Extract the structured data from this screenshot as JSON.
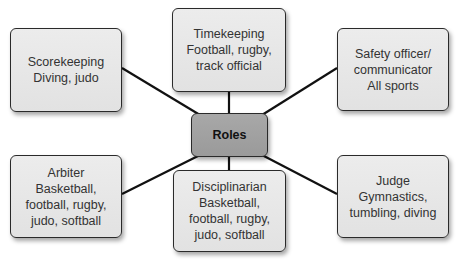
{
  "diagram": {
    "type": "hub-and-spoke",
    "center": {
      "label": "Roles"
    },
    "nodes": [
      {
        "id": "scorekeeping",
        "role": "Scorekeeping",
        "lines": [
          "Scorekeeping",
          "Diving, judo"
        ]
      },
      {
        "id": "timekeeping",
        "role": "Timekeeping",
        "lines": [
          "Timekeeping",
          "Football, rugby,",
          "track official"
        ]
      },
      {
        "id": "safety-officer",
        "role": "Safety officer/ communicator",
        "lines": [
          "Safety officer/",
          "communicator",
          "All sports"
        ]
      },
      {
        "id": "arbiter",
        "role": "Arbiter",
        "lines": [
          "Arbiter",
          "Basketball,",
          "football, rugby,",
          "judo, softball"
        ]
      },
      {
        "id": "disciplinarian",
        "role": "Disciplinarian",
        "lines": [
          "Disciplinarian",
          "Basketball,",
          "football, rugby,",
          "judo, softball"
        ]
      },
      {
        "id": "judge",
        "role": "Judge",
        "lines": [
          "Judge",
          "Gymnastics,",
          "tumbling, diving"
        ]
      }
    ],
    "colors": {
      "center_fill": "#9f9f9f",
      "node_fill": "#e6e6e6",
      "border": "#2a2a2a",
      "connector": "#111111",
      "text": "#333333"
    }
  }
}
